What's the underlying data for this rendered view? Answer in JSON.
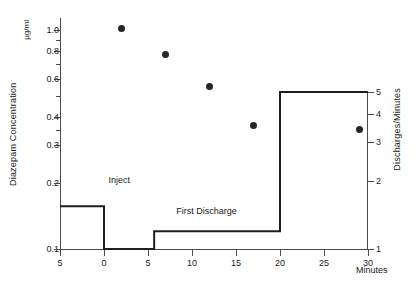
{
  "chart_data": {
    "type": "scatter",
    "title": "",
    "xlabel": "Minutes",
    "ylabel": "Diazepam Concentration",
    "yunit": "µg/ml",
    "ylabel_right": "Discharges/Minutes",
    "xlim": [
      -5,
      30
    ],
    "xticks": [
      -5,
      0,
      5,
      10,
      15,
      20,
      25,
      30
    ],
    "xticklabels": [
      "5",
      "0",
      "5",
      "10",
      "15",
      "20",
      "25",
      "30"
    ],
    "ylim": [
      0.1,
      1.12
    ],
    "yscale": "log",
    "yticks": [
      1.0,
      0.8,
      0.6,
      0.4,
      0.3,
      0.2,
      0.1
    ],
    "yticklabels": [
      "1.0",
      "0.8",
      "0.6",
      "0.4",
      "0.3",
      "0.2",
      "0.1"
    ],
    "yminorticks": [
      0.9,
      0.7,
      0.5,
      0.35
    ],
    "yscale_right": "log",
    "yticks_right": [
      5,
      4,
      3,
      2,
      1
    ],
    "yticklabels_right": [
      "5",
      "4",
      "3",
      "2",
      "1"
    ],
    "grid": false,
    "legend": false,
    "series": [
      {
        "name": "Diazepam Concentration",
        "marker": "filled-circle",
        "color": "#262626",
        "axis": "left",
        "points": [
          {
            "x": 2.0,
            "y": 1.02
          },
          {
            "x": 7.0,
            "y": 0.77
          },
          {
            "x": 12.0,
            "y": 0.55
          },
          {
            "x": 17.0,
            "y": 0.365
          },
          {
            "x": 29.0,
            "y": 0.35
          }
        ]
      },
      {
        "name": "Discharges/Minutes",
        "type": "step",
        "color": "#1f1f1f",
        "axis": "right",
        "steps": [
          {
            "x": -5.0,
            "y": 1.55
          },
          {
            "x": 0.0,
            "y": 1.55
          },
          {
            "x": 0.0,
            "y": 1.0
          },
          {
            "x": 5.7,
            "y": 1.0
          },
          {
            "x": 5.7,
            "y": 1.2
          },
          {
            "x": 20.0,
            "y": 1.2
          },
          {
            "x": 20.0,
            "y": 5.0
          },
          {
            "x": 30.0,
            "y": 5.0
          }
        ]
      }
    ],
    "annotations": [
      {
        "text": "Inject",
        "x": 0.5,
        "y": 0.205
      },
      {
        "text": "First Discharge",
        "x": 8.2,
        "y": 0.148
      }
    ]
  }
}
